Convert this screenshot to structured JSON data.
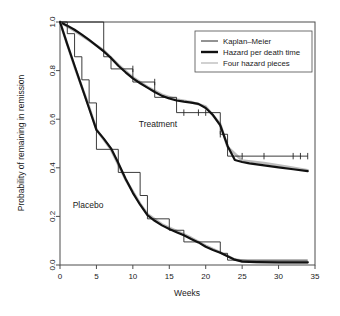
{
  "figure": {
    "background_color": "#ffffff",
    "frame_color": "#4d4d4d"
  },
  "axes": {
    "xlabel": "Weeks",
    "ylabel": "Probability of remaining in remission",
    "xticks": [
      "0",
      "5",
      "10",
      "15",
      "20",
      "25",
      "30",
      "35"
    ],
    "yticks": [
      "0.0",
      "0.2",
      "0.4",
      "0.6",
      "0.8",
      "1.0"
    ]
  },
  "legend": {
    "items": [
      {
        "label": "Kaplan–Meier",
        "style": "thin-dark",
        "color": "#262626"
      },
      {
        "label": "Hazard per death time",
        "style": "thick-dark",
        "color": "#111111"
      },
      {
        "label": "Four hazard pieces",
        "style": "thin-light",
        "color": "#bdbdbd"
      }
    ]
  },
  "annotations": [
    {
      "name": "treatment-label",
      "text": "Treatment"
    },
    {
      "name": "placebo-label",
      "text": "Placebo"
    }
  ],
  "chart_data": {
    "type": "line",
    "title": "",
    "xlabel": "Weeks",
    "ylabel": "Probability of remaining in remission",
    "xlim": [
      0,
      35
    ],
    "ylim": [
      0.0,
      1.0
    ],
    "xticks": [
      0,
      5,
      10,
      15,
      20,
      25,
      30,
      35
    ],
    "yticks": [
      0.0,
      0.2,
      0.4,
      0.6,
      0.8,
      1.0
    ],
    "grid": false,
    "legend_position": "top-right",
    "groups": [
      {
        "name": "Treatment",
        "kaplan_meier_steps": {
          "x": [
            0,
            6,
            7,
            10,
            13,
            16,
            22,
            23,
            34
          ],
          "y": [
            1.0,
            0.857,
            0.807,
            0.753,
            0.69,
            0.627,
            0.538,
            0.448,
            0.448
          ]
        },
        "hazard_per_death_time": {
          "x": [
            0,
            1,
            2,
            3,
            4,
            5,
            6,
            7,
            8,
            9,
            10,
            11,
            12,
            13,
            14,
            15,
            16,
            17,
            18,
            19,
            20,
            21,
            22,
            23,
            24,
            25,
            26,
            28,
            30,
            32,
            34
          ],
          "y": [
            1.0,
            0.985,
            0.968,
            0.948,
            0.926,
            0.903,
            0.879,
            0.852,
            0.82,
            0.793,
            0.768,
            0.748,
            0.73,
            0.712,
            0.696,
            0.685,
            0.677,
            0.672,
            0.668,
            0.663,
            0.646,
            0.617,
            0.575,
            0.49,
            0.432,
            0.424,
            0.418,
            0.41,
            0.402,
            0.394,
            0.386
          ]
        },
        "four_hazard_pieces": {
          "x": [
            0,
            2,
            4,
            6,
            8,
            10,
            12,
            14,
            16,
            18,
            20,
            22,
            23,
            25,
            28,
            31,
            34
          ],
          "y": [
            1.0,
            0.963,
            0.924,
            0.883,
            0.824,
            0.772,
            0.733,
            0.701,
            0.681,
            0.671,
            0.652,
            0.58,
            0.486,
            0.43,
            0.42,
            0.405,
            0.39
          ]
        },
        "censor_marks": {
          "x": [
            10,
            13,
            17,
            19,
            20,
            22,
            25,
            28,
            32,
            33,
            34
          ],
          "y": [
            0.807,
            0.753,
            0.627,
            0.627,
            0.627,
            0.538,
            0.448,
            0.448,
            0.448,
            0.448,
            0.448
          ]
        }
      },
      {
        "name": "Placebo",
        "kaplan_meier_steps": {
          "x": [
            0,
            1,
            2,
            3,
            4,
            5,
            8,
            11,
            12,
            15,
            17,
            22,
            23,
            34
          ],
          "y": [
            1.0,
            0.952,
            0.857,
            0.762,
            0.667,
            0.476,
            0.381,
            0.286,
            0.19,
            0.143,
            0.095,
            0.048,
            0.02,
            0.02
          ]
        },
        "hazard_per_death_time": {
          "x": [
            0,
            1,
            2,
            3,
            4,
            5,
            6,
            7,
            8,
            9,
            10,
            11,
            12,
            13,
            14,
            15,
            16,
            17,
            18,
            19,
            20,
            21,
            22,
            23,
            24,
            25,
            27,
            30,
            34
          ],
          "y": [
            1.0,
            0.908,
            0.82,
            0.732,
            0.644,
            0.556,
            0.52,
            0.48,
            0.42,
            0.355,
            0.297,
            0.248,
            0.205,
            0.182,
            0.163,
            0.148,
            0.135,
            0.122,
            0.107,
            0.093,
            0.075,
            0.062,
            0.05,
            0.036,
            0.022,
            0.014,
            0.012,
            0.011,
            0.011
          ]
        },
        "four_hazard_pieces": {
          "x": [
            0,
            2,
            4,
            5,
            7,
            9,
            11,
            12,
            14,
            16,
            18,
            20,
            22,
            24,
            26,
            30,
            34
          ],
          "y": [
            1.0,
            0.816,
            0.65,
            0.558,
            0.475,
            0.352,
            0.252,
            0.21,
            0.167,
            0.14,
            0.112,
            0.08,
            0.052,
            0.022,
            0.014,
            0.012,
            0.011
          ]
        },
        "censor_marks": {
          "x": [],
          "y": []
        }
      }
    ]
  }
}
